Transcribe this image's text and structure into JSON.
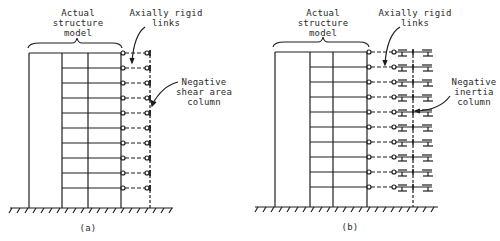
{
  "figure_a": {
    "caption": "(a)",
    "label_model": "Actual\nstructure\nmodel",
    "label_links": "Axially rigid\nlinks",
    "label_column": "Negative\nshear area\ncolumn"
  },
  "figure_b": {
    "caption": "(b)",
    "label_model": "Actual\nstructure\nmodel",
    "label_links": "Axially rigid\nlinks",
    "label_column": "Negative\ninertia\ncolumn"
  },
  "structure": {
    "stories": 10,
    "floor_levels_a": [
      53,
      68,
      83,
      98,
      113,
      128,
      143,
      158,
      173,
      188
    ],
    "floor_levels_b": [
      52,
      67,
      82,
      97,
      112,
      127,
      142,
      157,
      172,
      187
    ]
  },
  "colors": {
    "line": "#1e1e1e",
    "text": "#2a2a2a",
    "background": "#ffffff"
  }
}
